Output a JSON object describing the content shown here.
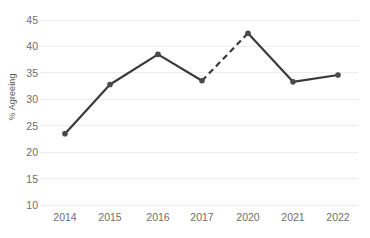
{
  "chart_data": {
    "type": "line",
    "title": "",
    "xlabel": "",
    "ylabel": "% Agreeing",
    "categories": [
      "2014",
      "2015",
      "2016",
      "2017",
      "2020",
      "2021",
      "2022"
    ],
    "values": [
      23.5,
      32.8,
      38.5,
      33.5,
      42.5,
      33.3,
      34.6
    ],
    "series": [
      {
        "name": "% Agreeing",
        "values": [
          23.5,
          32.8,
          38.5,
          33.5,
          42.5,
          33.3,
          34.6
        ]
      }
    ],
    "ylim": [
      10,
      45
    ],
    "y_ticks": [
      45,
      40,
      35,
      30,
      25,
      20,
      15,
      10
    ],
    "y_tick_labels": [
      "45",
      "40",
      "35",
      "30",
      "25",
      "20",
      "15",
      "10"
    ],
    "grid": true,
    "legend": "none",
    "line_color": "#3a3a3a",
    "marker_color": "#4a4a4a",
    "grid_color": "#ededed",
    "tick_label_color": "#6e6e6e",
    "dashed_segments": [
      {
        "from": "2017",
        "to": "2020",
        "note": "gap years 2018-2019 not surveyed"
      }
    ],
    "annotations": []
  },
  "axis": {
    "y_title": "% Agreeing"
  }
}
